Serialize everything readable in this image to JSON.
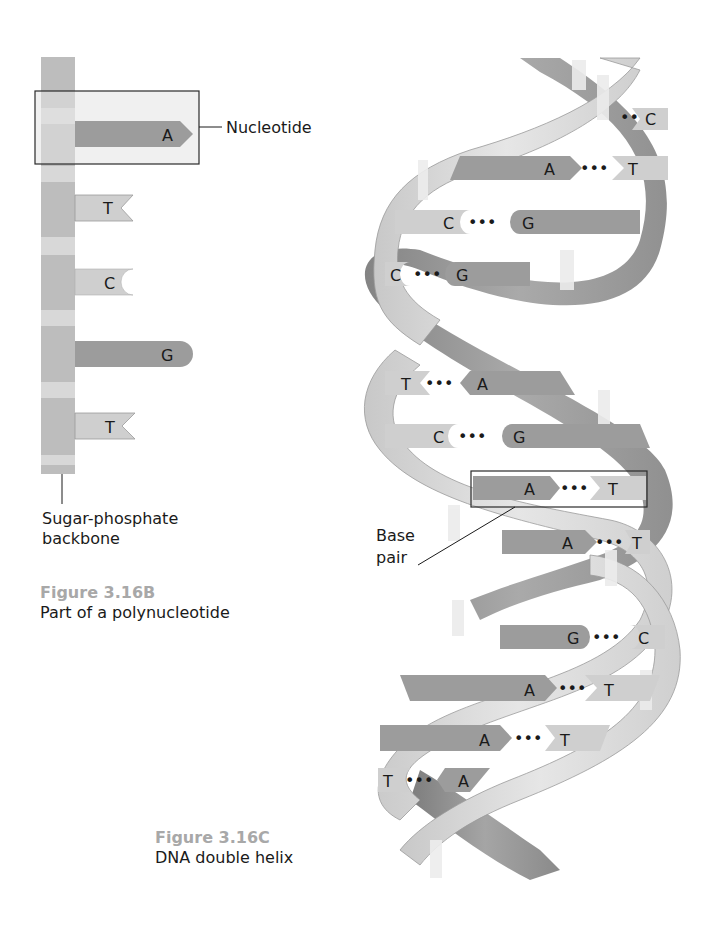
{
  "colors": {
    "backbone_dark": "#b8b8b8",
    "backbone_light": "#d6d6d6",
    "purine": "#9c9c9c",
    "pyrimidine": "#cfcfcf",
    "ribbon_light": "#d9d9d9",
    "ribbon_dark": "#8f8f8f",
    "caption_number": "#a8a8a8"
  },
  "figure_b": {
    "label_nucleotide": "Nucleotide",
    "label_backbone_line1": "Sugar-phosphate",
    "label_backbone_line2": "backbone",
    "number": "Figure 3.16B",
    "title": "Part of a polynucleotide",
    "bases": [
      {
        "letter": "A",
        "type": "purine",
        "shape": "arrow"
      },
      {
        "letter": "T",
        "type": "pyrimidine",
        "shape": "notch"
      },
      {
        "letter": "C",
        "type": "pyrimidine",
        "shape": "concave"
      },
      {
        "letter": "G",
        "type": "purine",
        "shape": "round"
      },
      {
        "letter": "T",
        "type": "pyrimidine",
        "shape": "notch"
      }
    ]
  },
  "figure_c": {
    "label_base_pair_line1": "Base",
    "label_base_pair_line2": "pair",
    "number": "Figure 3.16C",
    "title": "DNA double helix",
    "dots": "•••",
    "base_pairs": [
      {
        "left": "",
        "right": "C"
      },
      {
        "left": "A",
        "right": "T"
      },
      {
        "left": "C",
        "right": "G"
      },
      {
        "left": "C",
        "right": "G"
      },
      {
        "left": "T",
        "right": "A"
      },
      {
        "left": "C",
        "right": "G"
      },
      {
        "left": "A",
        "right": "T"
      },
      {
        "left": "A",
        "right": "T"
      },
      {
        "left": "G",
        "right": "C"
      },
      {
        "left": "A",
        "right": "T"
      },
      {
        "left": "A",
        "right": "T"
      },
      {
        "left": "T",
        "right": "A"
      }
    ]
  }
}
